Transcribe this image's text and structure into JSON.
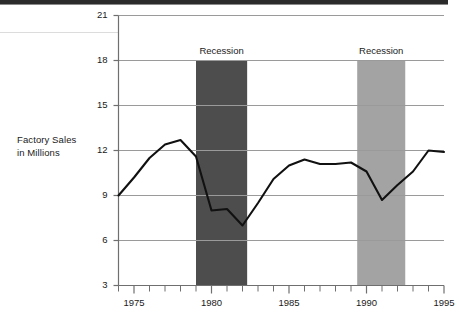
{
  "figure": {
    "axis_title_line1": "Factory Sales",
    "axis_title_line2": "in Millions",
    "band1_label": "Recession",
    "band2_label": "Recession"
  },
  "colors": {
    "line": "#111111",
    "grid": "#9a9a9a",
    "axis": "#6f6f6f",
    "band1": "#4d4d4d",
    "band2": "#a3a3a3",
    "text": "#1a1a1a",
    "background": "#ffffff"
  },
  "chart_data": {
    "type": "line",
    "title": "",
    "xlabel": "",
    "ylabel": "Factory Sales in Millions",
    "xlim": [
      1974,
      1995
    ],
    "ylim": [
      3,
      21
    ],
    "yticks": [
      3,
      6,
      9,
      12,
      15,
      18,
      21
    ],
    "ytick_labels": [
      "3",
      "6",
      "9",
      "12",
      "15",
      "18",
      "21"
    ],
    "xticks": [
      1974,
      1975,
      1976,
      1977,
      1978,
      1979,
      1980,
      1981,
      1982,
      1983,
      1984,
      1985,
      1986,
      1987,
      1988,
      1989,
      1990,
      1991,
      1992,
      1993,
      1994,
      1995
    ],
    "xtick_labels_major": [
      "1975",
      "1980",
      "1985",
      "1990",
      "1995"
    ],
    "xticks_major": [
      1975,
      1980,
      1985,
      1990,
      1995
    ],
    "grid": "horizontal",
    "legend": "none",
    "x": [
      1974,
      1975,
      1976,
      1977,
      1978,
      1979,
      1980,
      1981,
      1982,
      1983,
      1984,
      1985,
      1986,
      1987,
      1988,
      1989,
      1990,
      1991,
      1992,
      1993,
      1994,
      1995
    ],
    "values": [
      9.0,
      10.2,
      11.5,
      12.4,
      12.7,
      11.6,
      8.0,
      8.1,
      7.0,
      8.5,
      10.1,
      11.0,
      11.4,
      11.1,
      11.1,
      11.2,
      10.6,
      8.7,
      9.7,
      10.6,
      12.0,
      11.9
    ],
    "series": [
      {
        "name": "Factory Sales in Millions",
        "values": [
          9.0,
          10.2,
          11.5,
          12.4,
          12.7,
          11.6,
          8.0,
          8.1,
          7.0,
          8.5,
          10.1,
          11.0,
          11.4,
          11.1,
          11.1,
          11.2,
          10.6,
          8.7,
          9.7,
          10.6,
          12.0,
          11.9
        ]
      }
    ],
    "annotations": [
      {
        "label": "Recession",
        "type": "shaded-band",
        "x_start": 1979.0,
        "x_end": 1982.3,
        "y_top": 18,
        "y_bottom": 3,
        "color": "#4d4d4d"
      },
      {
        "label": "Recession",
        "type": "shaded-band",
        "x_start": 1989.4,
        "x_end": 1992.5,
        "y_top": 18,
        "y_bottom": 3,
        "color": "#a3a3a3"
      }
    ]
  }
}
